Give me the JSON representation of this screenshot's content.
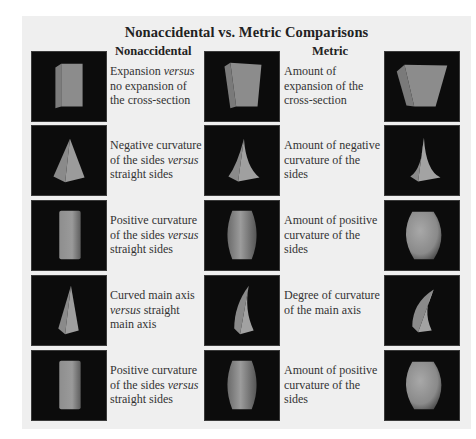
{
  "title": "Nonaccidental vs. Metric Comparisons",
  "headings": {
    "nonaccidental": "Nonaccidental",
    "metric": "Metric"
  },
  "colors": {
    "panel_background": "#efefef",
    "image_background": "#0c0c0c",
    "shape_fill": "#8a8a8a",
    "shape_shadow": "#6a6a6a",
    "shape_highlight": "#a6a6a6"
  },
  "rows": [
    {
      "images": [
        "box-straight-icon",
        "box-slight-expansion-icon",
        "box-strong-expansion-icon"
      ],
      "nonaccidental": {
        "pre": "Expansion ",
        "em": "versus",
        "post": " no expansion of the cross-section"
      },
      "metric": "Amount of expansion of the cross-section"
    },
    {
      "images": [
        "pyramid-straight-icon",
        "pyramid-slight-concave-icon",
        "pyramid-strong-concave-icon"
      ],
      "nonaccidental": {
        "pre": "Negative curvature of the sides ",
        "em": "versus",
        "post": " straight sides"
      },
      "metric": "Amount of negative curvature of the sides"
    },
    {
      "images": [
        "cylinder-icon",
        "barrel-slight-icon",
        "barrel-strong-icon"
      ],
      "nonaccidental": {
        "pre": "Positive curvature of the sides ",
        "em": "versus",
        "post": " straight sides"
      },
      "metric": "Amount of positive curvature of the sides"
    },
    {
      "images": [
        "cone-straight-axis-icon",
        "cone-slight-curve-icon",
        "cone-strong-curve-icon"
      ],
      "nonaccidental": {
        "pre": "Curved main axis ",
        "em": "versus",
        "post": " straight main axis"
      },
      "metric": "Degree of curvature of the main axis"
    },
    {
      "images": [
        "cylinder-icon",
        "barrel-slight-icon",
        "barrel-strong-icon"
      ],
      "nonaccidental": {
        "pre": "Positive curvature of the sides ",
        "em": "versus",
        "post": " straight sides"
      },
      "metric": "Amount of positive curvature of the sides"
    }
  ]
}
